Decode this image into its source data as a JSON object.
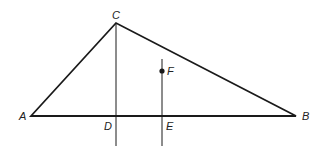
{
  "diagram": {
    "type": "geometry-triangle",
    "points": {
      "A": {
        "label": "A",
        "x": 31,
        "y": 116
      },
      "B": {
        "label": "B",
        "x": 296,
        "y": 116
      },
      "C": {
        "label": "C",
        "x": 116,
        "y": 23
      },
      "D": {
        "label": "D",
        "x": 116,
        "y": 116
      },
      "E": {
        "label": "E",
        "x": 162,
        "y": 116
      },
      "F": {
        "label": "F",
        "x": 162,
        "y": 71
      }
    },
    "colors": {
      "line": "#1a1a1a",
      "background": "#ffffff"
    }
  }
}
